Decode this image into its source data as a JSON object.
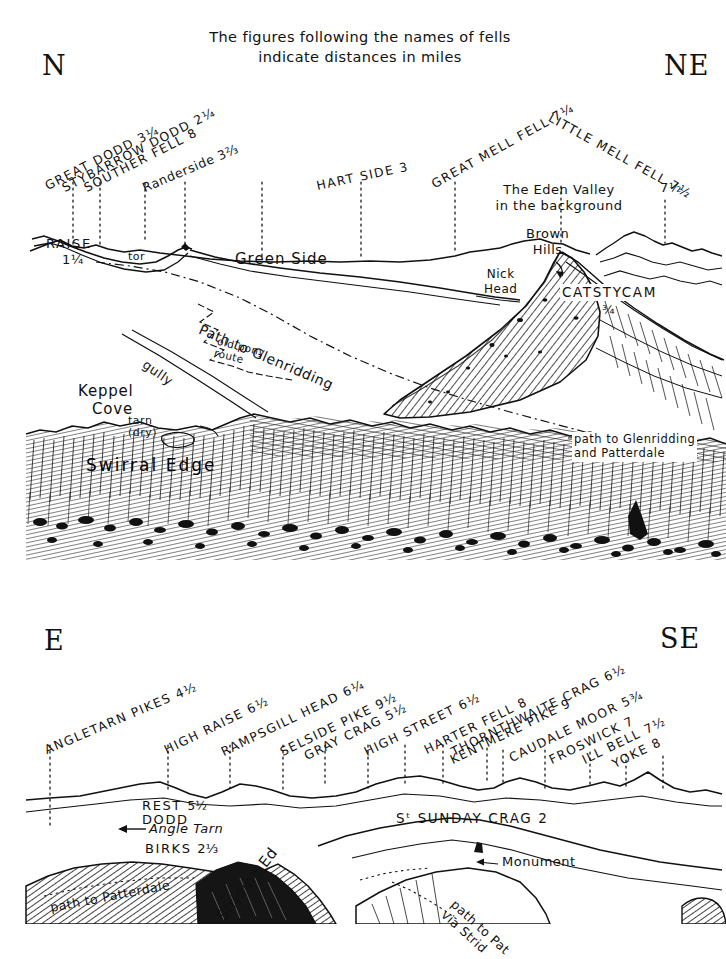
{
  "caption": {
    "line1": "The figures following the names of fells",
    "line2": "indicate distances in miles"
  },
  "panels": [
    {
      "id": "north-northeast-panel",
      "compass_left": "N",
      "compass_right": "NE",
      "skyline_fells": [
        {
          "name": "GREAT DODD",
          "distance": "3¼",
          "label": "GREAT DODD 3¼"
        },
        {
          "name": "STYBARROW DODD",
          "distance": "2¼",
          "label": "STYBARROW DODD 2¼"
        },
        {
          "name": "SOUTHER FELL",
          "distance": "8",
          "label": "SOUTHER FELL 8"
        },
        {
          "name": "Randerside",
          "distance": "3⅔",
          "label": "Randerside 3⅔"
        },
        {
          "name": "HART SIDE",
          "distance": "3",
          "label": "HART SIDE 3"
        },
        {
          "name": "GREAT MELL FELL",
          "distance": "7¼",
          "label": "GREAT MELL FELL 7¼"
        },
        {
          "name": "LITTLE MELL FELL",
          "distance": "7½",
          "label": "LITTLE MELL FELL 7½"
        }
      ],
      "annotations": [
        {
          "name": "raise",
          "text": "RAISE",
          "distance": "1¼"
        },
        {
          "name": "tor",
          "text": "tor"
        },
        {
          "name": "green-side",
          "text": "Green Side"
        },
        {
          "name": "eden-valley",
          "text": "The Eden Valley",
          "text2": "in the background"
        },
        {
          "name": "brown-hills",
          "text": "Brown",
          "text2": "Hills"
        },
        {
          "name": "nick-head",
          "text": "Nick",
          "text2": "Head"
        },
        {
          "name": "catstycam",
          "text": "CATSTYCAM",
          "distance": "¾"
        },
        {
          "name": "path-to-glenridding",
          "text": "Path to Glenridding"
        },
        {
          "name": "old-pony-route",
          "text": "old pony",
          "text2": "route"
        },
        {
          "name": "gully",
          "text": "gully"
        },
        {
          "name": "keppel-cove",
          "text": "Keppel",
          "text2": "Cove"
        },
        {
          "name": "tarn-dry",
          "text": "tarn",
          "text2": "(dry)"
        },
        {
          "name": "swirral-edge",
          "text": "Swirral Edge"
        },
        {
          "name": "path-glenridding-patterdale",
          "text": "path to Glenridding",
          "text2": "and Patterdale"
        }
      ]
    },
    {
      "id": "east-southeast-panel",
      "compass_left": "E",
      "compass_right": "SE",
      "skyline_fells": [
        {
          "name": "ANGLETARN PIKES",
          "distance": "4½",
          "label": "ANGLETARN PIKES 4½"
        },
        {
          "name": "HIGH RAISE",
          "distance": "6½",
          "label": "HIGH RAISE 6½"
        },
        {
          "name": "RAMPSGILL HEAD",
          "distance": "6¼",
          "label": "RAMPSGILL HEAD 6¼"
        },
        {
          "name": "SELSIDE PIKE",
          "distance": "9½",
          "label": "SELSIDE PIKE 9½"
        },
        {
          "name": "GRAY CRAG",
          "distance": "5½",
          "label": "GRAY CRAG 5½"
        },
        {
          "name": "HIGH STREET",
          "distance": "6½",
          "label": "HIGH STREET 6½"
        },
        {
          "name": "HARTER FELL",
          "distance": "8",
          "label": "HARTER FELL 8"
        },
        {
          "name": "THORNTHWAITE CRAG",
          "distance": "6½",
          "label": "THORNTHWAITE CRAG 6½"
        },
        {
          "name": "KENTMERE PIKE",
          "distance": "9",
          "label": "KENTMERE PIKE 9"
        },
        {
          "name": "CAUDALE MOOR",
          "distance": "5¾",
          "label": "CAUDALE MOOR 5¾"
        },
        {
          "name": "FROSWICK",
          "distance": "7",
          "label": "FROSWICK 7"
        },
        {
          "name": "ILL BELL",
          "distance": "7½",
          "label": "ILL BELL 7½"
        },
        {
          "name": "YOKE",
          "distance": "8",
          "label": "YOKE 8"
        }
      ],
      "annotations": [
        {
          "name": "rest-dodd",
          "text": "REST",
          "text2": "DODD",
          "distance": "5½"
        },
        {
          "name": "angle-tarn",
          "text": "Angle Tarn"
        },
        {
          "name": "birks",
          "text": "BIRKS",
          "distance": "2⅓"
        },
        {
          "name": "st-sunday-crag",
          "text": "Sᵗ SUNDAY CRAG 2"
        },
        {
          "name": "monument",
          "text": "Monument"
        },
        {
          "name": "path-to-patterdale",
          "text": "path to Patterdale"
        },
        {
          "name": "striding-edge",
          "text": "Striding Ed"
        },
        {
          "name": "path-to-patterdale-via-striding",
          "text": "path to Pat",
          "text2": "via Strid"
        }
      ]
    }
  ],
  "colors": {
    "ink": "#111111",
    "paper": "#ffffff"
  }
}
